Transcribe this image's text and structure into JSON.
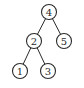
{
  "diagram": {
    "type": "binary-tree",
    "stroke_color": "#2a2a2a",
    "background": "#ffffff",
    "node_radius": 7.5,
    "nodes": [
      {
        "id": "n4",
        "label": "4",
        "x": 49,
        "y": 12
      },
      {
        "id": "n2",
        "label": "2",
        "x": 34,
        "y": 41
      },
      {
        "id": "n5",
        "label": "5",
        "x": 64,
        "y": 41
      },
      {
        "id": "n1",
        "label": "1",
        "x": 20,
        "y": 71
      },
      {
        "id": "n3",
        "label": "3",
        "x": 48,
        "y": 71
      }
    ],
    "edges": [
      {
        "from": "n4",
        "to": "n2"
      },
      {
        "from": "n4",
        "to": "n5"
      },
      {
        "from": "n2",
        "to": "n1"
      },
      {
        "from": "n2",
        "to": "n3"
      }
    ]
  }
}
